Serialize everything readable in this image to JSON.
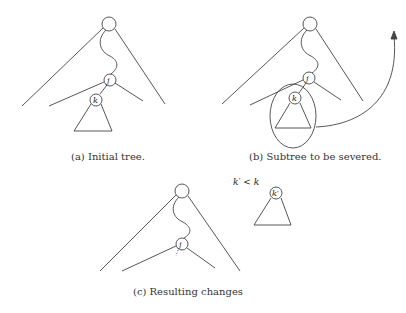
{
  "figure": {
    "panels": [
      {
        "id": "a",
        "caption": "(a) Initial tree.",
        "nodes": {
          "root": "",
          "j": "j",
          "k": "k"
        }
      },
      {
        "id": "b",
        "caption": "(b) Subtree to be severed.",
        "nodes": {
          "root": "",
          "j": "j",
          "k": "k"
        }
      },
      {
        "id": "c",
        "caption": "(c) Resulting changes",
        "nodes": {
          "root": "",
          "j": "j",
          "k_prime": "k′"
        },
        "annotation": "k′ < k"
      }
    ],
    "stroke_color": "#444444"
  }
}
